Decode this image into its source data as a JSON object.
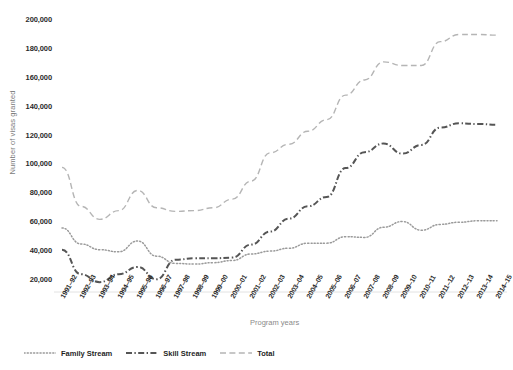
{
  "chart_data": {
    "type": "line",
    "title": "",
    "xlabel": "Program years",
    "ylabel": "Number of visas granted",
    "ylim": [
      0,
      200000
    ],
    "yticks": [
      "20,000",
      "40,000",
      "60,000",
      "80,000",
      "100,000",
      "120,000",
      "140,000",
      "160,000",
      "180,000",
      "200,000"
    ],
    "ytick_values": [
      20000,
      40000,
      60000,
      80000,
      100000,
      120000,
      140000,
      160000,
      180000,
      200000
    ],
    "grid": false,
    "legend_position": "bottom-left",
    "categories": [
      "1991–92",
      "1992–93",
      "1993–94",
      "1994–95",
      "1995–96",
      "1996–97",
      "1997–98",
      "1998–99",
      "1999–00",
      "2000–01",
      "2001–02",
      "2002–03",
      "2003–04",
      "2004–05",
      "2005–06",
      "2006–07",
      "2007–08",
      "2008–09",
      "2009–10",
      "2010–11",
      "2011–12",
      "2012–13",
      "2013–14",
      "2014–15"
    ],
    "series": [
      {
        "name": "Family Stream",
        "style": "dotted",
        "color": "#9a9a9a",
        "values": [
          56000,
          45000,
          41000,
          39500,
          47000,
          36500,
          31500,
          31000,
          32000,
          33500,
          38000,
          40000,
          42000,
          45500,
          45500,
          50000,
          49500,
          56500,
          60500,
          54500,
          58500,
          60000,
          61000,
          61000
        ]
      },
      {
        "name": "Skill Stream",
        "style": "dash-dot",
        "color": "#555555",
        "values": [
          41000,
          24000,
          18500,
          24000,
          29000,
          20500,
          34000,
          35000,
          35000,
          35500,
          44500,
          53500,
          62500,
          71000,
          77500,
          97500,
          108500,
          114500,
          107500,
          113500,
          125500,
          128500,
          128000,
          127500
        ]
      },
      {
        "name": "Total",
        "style": "dashed",
        "color": "#b5b5b5",
        "values": [
          98000,
          71000,
          62000,
          68000,
          82000,
          70000,
          67500,
          68000,
          70000,
          76000,
          88500,
          108000,
          114000,
          123000,
          131000,
          148000,
          158500,
          171000,
          168500,
          168500,
          185000,
          190000,
          190000,
          189500
        ]
      }
    ]
  },
  "legend": {
    "items": [
      {
        "label": "Family Stream",
        "style": "dotted"
      },
      {
        "label": "Skill Stream",
        "style": "dash-dot"
      },
      {
        "label": "Total",
        "style": "dashed"
      }
    ]
  }
}
